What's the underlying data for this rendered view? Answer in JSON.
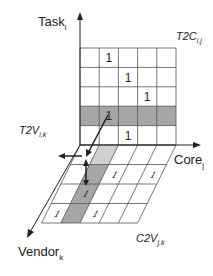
{
  "axes": {
    "task": {
      "label": "Task",
      "subscript": "i"
    },
    "core": {
      "label": "Core",
      "subscript": "j"
    },
    "vendor": {
      "label": "Vendor",
      "subscript": "k"
    }
  },
  "matrices": {
    "t2c": {
      "label": "T2C",
      "subscript": "i,j"
    },
    "t2v": {
      "label": "T2V",
      "subscript": "i,k"
    },
    "c2v": {
      "label": "C2V",
      "subscript": "j,k"
    }
  },
  "upper_grid": {
    "rows": 5,
    "cols": 5,
    "highlight_row": 3,
    "ones": [
      [
        0,
        1
      ],
      [
        1,
        2
      ],
      [
        2,
        3
      ],
      [
        3,
        1
      ],
      [
        4,
        2
      ]
    ],
    "cell_value": "1"
  },
  "lower_grid": {
    "rows": 4,
    "cols": 5,
    "highlight_col": 1,
    "ones": [
      [
        1,
        2
      ],
      [
        1,
        4
      ],
      [
        2,
        1
      ],
      [
        3,
        0
      ],
      [
        3,
        2
      ]
    ],
    "cell_value": "1"
  },
  "colors": {
    "line": "#555555",
    "highlight_dark": "#a6a6a6",
    "highlight_light": "#d0d0d0",
    "arrow": "#222222"
  }
}
